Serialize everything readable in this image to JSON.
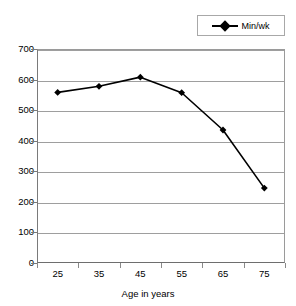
{
  "chart_data": {
    "type": "line",
    "title": "",
    "subtitle": "",
    "xlabel": "Age in years",
    "ylabel": "",
    "categories": [
      "25",
      "35",
      "45",
      "55",
      "65",
      "75"
    ],
    "x": [
      25,
      35,
      45,
      55,
      65,
      75
    ],
    "series": [
      {
        "name": "Min/wk",
        "values": [
          558,
          578,
          608,
          557,
          435,
          245
        ],
        "marker": "diamond",
        "color": "#000000"
      }
    ],
    "ylim": [
      0,
      700
    ],
    "yticks": [
      0,
      100,
      200,
      300,
      400,
      500,
      600,
      700
    ],
    "ytick_labels": [
      "0",
      "100",
      "200",
      "300",
      "400",
      "500",
      "600",
      "700"
    ],
    "grid": "horizontal",
    "legend_position": "top-right",
    "legend_entries": [
      "Min/wk"
    ],
    "annotations": []
  },
  "legend": {
    "items": [
      {
        "label": "Min/wk",
        "marker_icon": "diamond-marker-icon"
      }
    ]
  },
  "axes": {
    "x": {
      "title": "Age in years",
      "tick_labels": [
        "25",
        "35",
        "45",
        "55",
        "65",
        "75"
      ]
    },
    "y": {
      "title": "",
      "tick_labels": [
        "700",
        "600",
        "500",
        "400",
        "300",
        "200",
        "100",
        "0"
      ]
    }
  },
  "colors": {
    "series": "#000000",
    "gridline": "#9e9e9e",
    "axis": "#7a7a7a",
    "legend_border": "#a8a8a8",
    "background": "#ffffff"
  }
}
